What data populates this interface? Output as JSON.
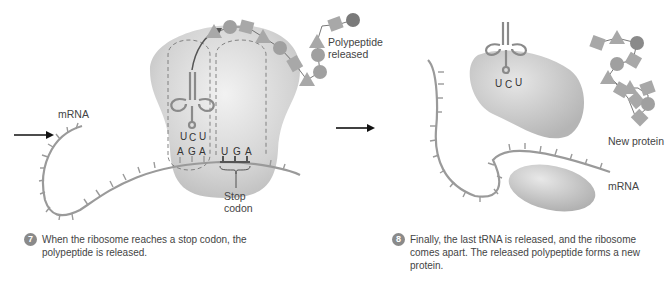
{
  "panel_left": {
    "labels": {
      "mrna": "mRNA",
      "polypeptide_released": "Polypeptide released",
      "stop_codon": "Stop codon"
    },
    "trna_anticodon": [
      "U",
      "C",
      "U"
    ],
    "codon_p_site": [
      "A",
      "G",
      "A"
    ],
    "codon_stop": [
      "U",
      "G",
      "A"
    ],
    "polypeptide_chain": [
      "Arg",
      "Met",
      "Leu",
      "Gly",
      "Phe",
      "Leu",
      "Gly",
      "Met",
      "Phe",
      "Gly",
      "Leu",
      "Met"
    ],
    "step": {
      "number": "7",
      "text": "When the ribosome reaches a stop codon, the polypeptide is released."
    }
  },
  "panel_right": {
    "labels": {
      "new_protein": "New protein",
      "mrna": "mRNA"
    },
    "trna_anticodon": [
      "U",
      "C",
      "U"
    ],
    "protein_residues": [
      "Phe",
      "Gly",
      "Met",
      "Met",
      "Leu",
      "Gly",
      "Gly",
      "Leu",
      "Leu",
      "Phe",
      "Met",
      "Arg"
    ],
    "step": {
      "number": "8",
      "text": "Finally, the last tRNA is released, and the ribosome comes apart. The released polypeptide forms a new protein."
    }
  },
  "colors": {
    "ribosome": "#d9d9d9",
    "strand": "#9a9a9a",
    "amino_fill": "#a8a8a8",
    "step_badge": "#8a8a8a",
    "text": "#444444"
  }
}
